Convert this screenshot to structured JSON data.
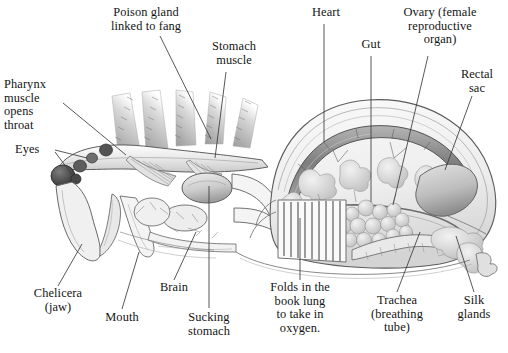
{
  "figure": {
    "type": "anatomical-illustration",
    "background_color": "#ffffff",
    "ink_color": "#141414",
    "leader_line_color": "#3a3a3a"
  },
  "labels": [
    {
      "id": "poison-gland",
      "text": "Poison gland\nlinked to fang",
      "x": 94,
      "y": 6,
      "w": 104,
      "align": "center"
    },
    {
      "id": "pharynx",
      "text": "Pharynx\nmuscle\nopens\nthroat",
      "x": 4,
      "y": 78,
      "w": 66,
      "align": "left"
    },
    {
      "id": "eyes",
      "text": "Eyes",
      "x": 15,
      "y": 143,
      "w": 42,
      "align": "left"
    },
    {
      "id": "stomach-muscle",
      "text": "Stomach\nmuscle",
      "x": 198,
      "y": 40,
      "w": 72,
      "align": "center"
    },
    {
      "id": "heart",
      "text": "Heart",
      "x": 307,
      "y": 6,
      "w": 46,
      "align": "center"
    },
    {
      "id": "gut",
      "text": "Gut",
      "x": 355,
      "y": 38,
      "w": 32,
      "align": "center"
    },
    {
      "id": "ovary",
      "text": "Ovary (female\nreproductive\norgan)",
      "x": 392,
      "y": 6,
      "w": 96,
      "align": "center"
    },
    {
      "id": "rectal-sac",
      "text": "Rectal\nsac",
      "x": 452,
      "y": 68,
      "w": 50,
      "align": "center"
    },
    {
      "id": "chelicera",
      "text": "Chelicera\n(jaw)",
      "x": 20,
      "y": 287,
      "w": 76,
      "align": "center"
    },
    {
      "id": "mouth",
      "text": "Mouth",
      "x": 98,
      "y": 311,
      "w": 48,
      "align": "center"
    },
    {
      "id": "brain",
      "text": "Brain",
      "x": 152,
      "y": 281,
      "w": 44,
      "align": "center"
    },
    {
      "id": "sucking-stomach",
      "text": "Sucking\nstomach",
      "x": 178,
      "y": 311,
      "w": 62,
      "align": "center"
    },
    {
      "id": "book-lung",
      "text": "Folds in the\nbook lung\nto take in\noxygen.",
      "x": 259,
      "y": 281,
      "w": 82,
      "align": "center"
    },
    {
      "id": "trachea",
      "text": "Trachea\n(breathing\ntube)",
      "x": 360,
      "y": 294,
      "w": 74,
      "align": "center"
    },
    {
      "id": "silk-glands",
      "text": "Silk\nglands",
      "x": 449,
      "y": 294,
      "w": 50,
      "align": "center"
    }
  ],
  "leaders": [
    {
      "id": "leader-poison-gland",
      "points": "160,36 211,139"
    },
    {
      "id": "leader-pharynx",
      "points": "63,103 126,155"
    },
    {
      "id": "leader-eyes",
      "points": "55,150 87,158"
    },
    {
      "id": "leader-eyes-2",
      "points": "55,152 73,176"
    },
    {
      "id": "leader-stomach-muscle",
      "points": "226,72 215,158"
    },
    {
      "id": "leader-heart",
      "points": "324,24 324,142"
    },
    {
      "id": "leader-gut",
      "points": "371,56 371,202"
    },
    {
      "id": "leader-ovary",
      "points": "428,56 393,205"
    },
    {
      "id": "leader-rectal-sac",
      "points": "472,96 445,170"
    },
    {
      "id": "leader-chelicera",
      "points": "58,286 82,244"
    },
    {
      "id": "leader-mouth",
      "points": "122,309 139,252"
    },
    {
      "id": "leader-brain",
      "points": "174,280 196,232"
    },
    {
      "id": "leader-sucking-stomach",
      "points": "209,308 209,186"
    },
    {
      "id": "leader-book-lung",
      "points": "300,280 300,218"
    },
    {
      "id": "leader-trachea",
      "points": "397,292 420,232"
    },
    {
      "id": "leader-silk-glands",
      "points": "474,292 456,236"
    }
  ]
}
